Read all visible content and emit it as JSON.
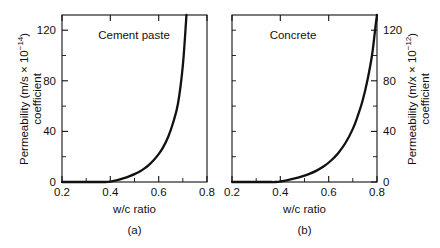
{
  "figure": {
    "background_color": "#ffffff",
    "ink_color": "#111111"
  },
  "panels": [
    {
      "key": "a",
      "caption": "(a)",
      "title": "Cement paste",
      "xlabel": "w/c ratio",
      "ylabel_line1_prefix": "Permeability (m/s ",
      "ylabel_line1_times": "×",
      "ylabel_line1_base": " 10",
      "ylabel_line1_exp": "−14",
      "ylabel_line1_suffix": ")",
      "ylabel_line2": "coefficient",
      "y_axis_side": "left",
      "x_ticks": [
        "0.2",
        "0.4",
        "0.6",
        "0.8"
      ],
      "y_ticks": [
        "0",
        "40",
        "80",
        "120"
      ]
    },
    {
      "key": "b",
      "caption": "(b)",
      "title": "Concrete",
      "xlabel": "w/c ratio",
      "ylabel_line1_prefix": "Permeability (m/x ",
      "ylabel_line1_times": "×",
      "ylabel_line1_base": " 10",
      "ylabel_line1_exp": "−12",
      "ylabel_line1_suffix": ")",
      "ylabel_line2": "coefficient",
      "y_axis_side": "right",
      "x_ticks": [
        "0.2",
        "0.4",
        "0.6",
        "0.8"
      ],
      "y_ticks": [
        "0",
        "40",
        "80",
        "120"
      ]
    }
  ],
  "chart_data": [
    {
      "type": "line",
      "panel": "a",
      "title": "Cement paste",
      "xlabel": "w/c ratio",
      "ylabel": "Permeability coefficient (m/s × 10⁻¹⁴)",
      "xlim": [
        0.2,
        0.8
      ],
      "ylim": [
        0,
        132
      ],
      "xticks": [
        0.2,
        0.4,
        0.6,
        0.8
      ],
      "xticks_minor": [
        0.3,
        0.5,
        0.7
      ],
      "yticks": [
        0,
        40,
        80,
        120
      ],
      "yticks_minor": [
        20,
        60,
        100
      ],
      "grid": false,
      "legend": "none",
      "annotation": "Cement paste",
      "x": [
        0.2,
        0.25,
        0.3,
        0.35,
        0.38,
        0.4,
        0.42,
        0.44,
        0.46,
        0.48,
        0.5,
        0.52,
        0.54,
        0.56,
        0.58,
        0.6,
        0.62,
        0.64,
        0.66,
        0.68,
        0.7,
        0.715
      ],
      "y": [
        0.0,
        0.0,
        0.0,
        0.0,
        0.0,
        0.3,
        1.0,
        2.0,
        3.2,
        4.6,
        6.2,
        8.2,
        10.6,
        13.6,
        17.4,
        22.0,
        28.0,
        36.0,
        47.0,
        62.0,
        92.0,
        132.0
      ]
    },
    {
      "type": "line",
      "panel": "b",
      "title": "Concrete",
      "xlabel": "w/c ratio",
      "ylabel": "Permeability coefficient (m/x × 10⁻¹²)",
      "xlim": [
        0.2,
        0.8
      ],
      "ylim": [
        0,
        132
      ],
      "xticks": [
        0.2,
        0.4,
        0.6,
        0.8
      ],
      "xticks_minor": [
        0.3,
        0.5,
        0.7
      ],
      "yticks": [
        0,
        40,
        80,
        120
      ],
      "yticks_minor": [
        20,
        60,
        100
      ],
      "grid": false,
      "legend": "none",
      "annotation": "Concrete",
      "x": [
        0.2,
        0.25,
        0.3,
        0.35,
        0.38,
        0.4,
        0.43,
        0.46,
        0.49,
        0.52,
        0.55,
        0.58,
        0.61,
        0.64,
        0.67,
        0.7,
        0.72,
        0.74,
        0.76,
        0.78,
        0.795,
        0.8
      ],
      "y": [
        0.0,
        0.0,
        0.0,
        0.0,
        0.0,
        0.4,
        1.4,
        2.8,
        4.4,
        6.4,
        9.0,
        12.4,
        17.0,
        23.0,
        31.0,
        42.0,
        52.0,
        64.0,
        80.0,
        101.0,
        125.0,
        132.0
      ]
    }
  ]
}
